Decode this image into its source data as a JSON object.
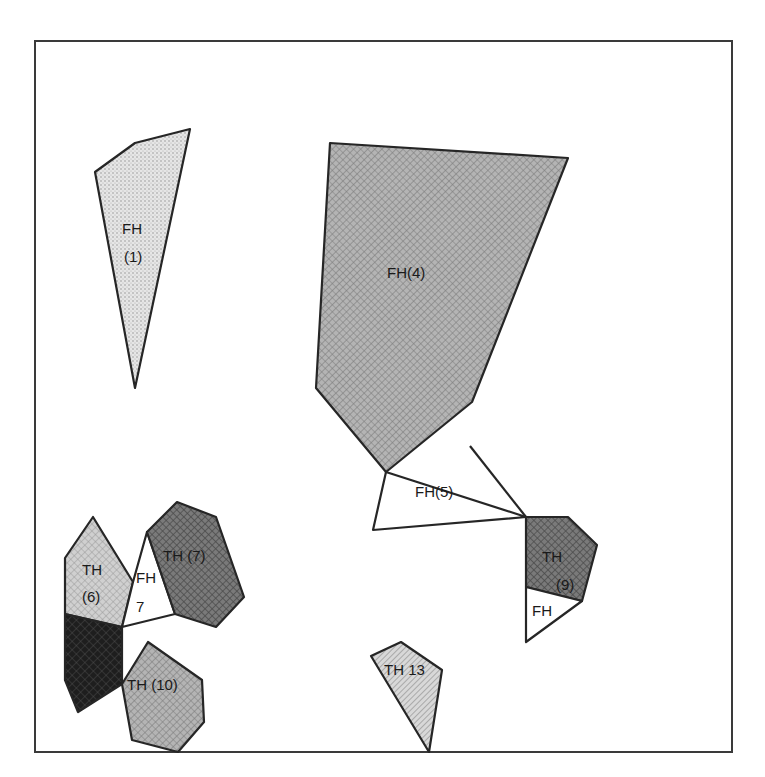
{
  "diagram": {
    "regions": [
      {
        "id": "fh1",
        "label_lines": [
          "FH",
          "(1)"
        ],
        "fill": "light-dots",
        "points": "95,172 135,143 190,129 135,388"
      },
      {
        "id": "fh4",
        "label_lines": [
          "FH(4)"
        ],
        "fill": "medium-crosshatch",
        "points": "330,143 568,158 472,402 386,472 316,388"
      },
      {
        "id": "fh5",
        "label_lines": [
          "FH(5)"
        ],
        "fill": "white",
        "points": "386,472 373,530 526,517"
      },
      {
        "id": "th9",
        "label_lines": [
          "TH",
          "(9)"
        ],
        "fill": "dark-crosshatch",
        "points": "526,517 568,517 597,545 582,601 526,587"
      },
      {
        "id": "fh9",
        "label_lines": [
          "FH"
        ],
        "fill": "white",
        "points": "526,587 582,601 526,642"
      },
      {
        "id": "th6",
        "label_lines": [
          "TH",
          "(6)"
        ],
        "fill": "light-crosshatch",
        "points": "65,558 93,517 133,582 122,627 65,614"
      },
      {
        "id": "fh7",
        "label_lines": [
          "FH",
          "7"
        ],
        "fill": "white",
        "points": "147,532 133,582 122,627 175,614"
      },
      {
        "id": "th7",
        "label_lines": [
          "TH (7)"
        ],
        "fill": "dark-crosshatch",
        "points": "147,532 177,502 216,517 244,597 216,627 175,614"
      },
      {
        "id": "dark",
        "label_lines": [],
        "fill": "black-crosshatch",
        "points": "65,614 122,627 122,684 78,712 65,680"
      },
      {
        "id": "th10",
        "label_lines": [
          "TH (10)"
        ],
        "fill": "medium-crosshatch",
        "points": "122,684 148,642 202,680 204,722 178,752 132,740"
      },
      {
        "id": "th13",
        "label_lines": [
          "TH 13"
        ],
        "fill": "light-diagonal",
        "points": "371,656 401,642 442,670 429,752"
      }
    ],
    "labels": {
      "fh1_a": "FH",
      "fh1_b": "(1)",
      "fh4": "FH(4)",
      "fh5": "FH(5)",
      "th9_a": "TH",
      "th9_b": "(9)",
      "fh9": "FH",
      "th6_a": "TH",
      "th6_b": "(6)",
      "fh7_a": "FH",
      "fh7_b": "7",
      "th7": "TH (7)",
      "th10": "TH (10)",
      "th13": "TH 13"
    },
    "colors": {
      "stroke": "#262626",
      "light_dots": "#dcdcdc",
      "medium": "#a6a6a6",
      "dark": "#6e6e6e",
      "black": "#2a2a2a",
      "light_cross": "#c4c4c4"
    }
  }
}
